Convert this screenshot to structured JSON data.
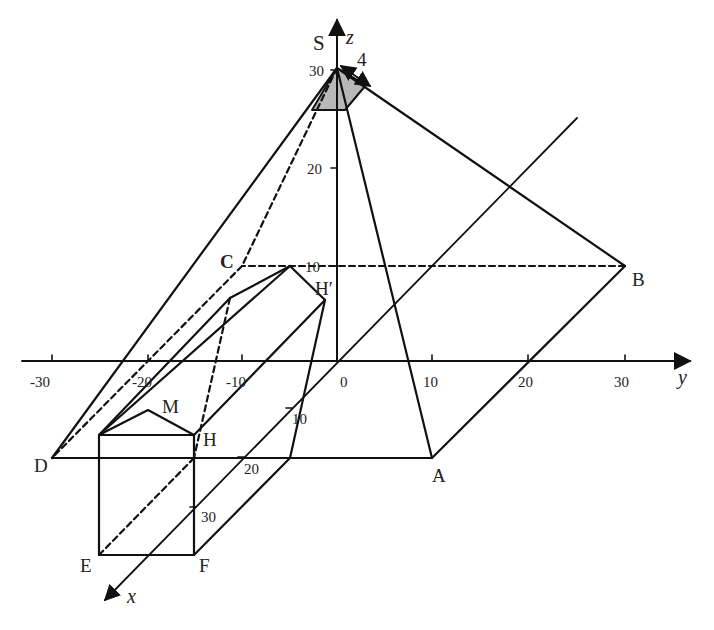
{
  "figure": {
    "colors": {
      "line": "#111111",
      "shade": "#b8b8b8",
      "background": "#ffffff"
    }
  },
  "axes": {
    "x_label": "x",
    "y_label": "y",
    "z_label": "z",
    "y_ticks": [
      "-30",
      "-20",
      "-10",
      "0",
      "10",
      "20",
      "30"
    ],
    "z_ticks": [
      "10",
      "20",
      "30"
    ],
    "x_ticks": [
      "10",
      "20",
      "30"
    ]
  },
  "points": {
    "S": "S",
    "A": "A",
    "B": "B",
    "C": "C",
    "D": "D",
    "E": "E",
    "F": "F",
    "H": "H",
    "H_prime": "H′",
    "M": "M"
  },
  "annotations": {
    "apex_dimension": "4"
  }
}
